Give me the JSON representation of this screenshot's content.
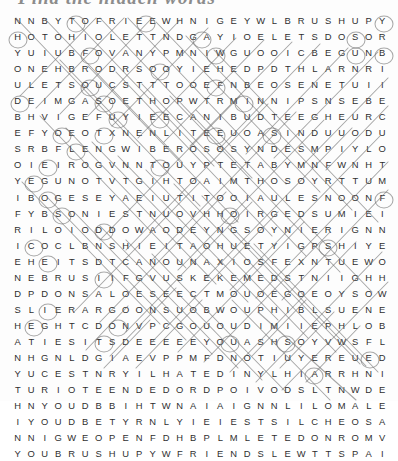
{
  "title": {
    "text": "Find the hidden words"
  },
  "puzzle": {
    "name": "word-search-grid",
    "rows": 24,
    "columns": 27,
    "letter_color": "#2f2f2f",
    "mark_color": "#6f6f6f",
    "background_color": "#fdfdfd",
    "grid": [
      "NNBYTOFRIEEWHNIGEYWLBRUSHUPY",
      "HOTOHIOLETTNDGAYIOELETSDOSOR",
      "YUIUBFOVANYPMNIWGUOOICBEGUNB",
      "ONEHBRODRSOOYIEHEDPDTHLARNRI",
      "ULETSOUCSTTTOOEFNBEOSENETUII",
      "DEIMGASOETHOPWTRMINNIPSNSEBE",
      "BHVIGEFUYIEECANIBUDTEEGHEURC",
      "EFYOEOTXNENLITEEUOASINDUUODUE",
      "SRBFLENGWIBEROSOSYNDESMPIYLOSS",
      "OIEIROGVNNTOUYPTETABYMNFWNHT",
      "YEGUNOTVTGIHTOAIMTHOSOYRTTUM",
      "IBOGESEYAEIUTITOOIAULESNOONFPA",
      "FYBSONIESTNUOVHHOIRGEDSUMIEIE",
      "RILOIODDOWAODEYNGSOYNIERIGNNW",
      "ICOCLBNSHIEITAOHUETYIGPSHIYE",
      "EHEITSDTCANOUNANAXIOSFEXNTUEWO",
      "NEBRUSIIFGVUSKEKEMEDSTNIIGHHDL",
      "DPDONSALOESEECTMOUOEGOEOYSOW",
      "SLIERARGOONSUOBWOUPHIBLSUENE",
      "HEGHTCDONVPCGOUOUDIMIIEPHLOBTL",
      "ATIESITSDEEEEEYOUASHSOYVWSFL",
      "NHGNLDGIAEVPPMFDNOTIUYEREUED",
      "YUCESTNRYILHATEDINYLHIARRHNI",
      "TURIOTEENDEDORDPOIVODSLTNWDEJD",
      "HNYOUDBBIHTWNAIAIGNNLILOMALEHY",
      "IYOUDBETYRNLYIEIESTSILCHEOSATC",
      "NNIGWEOPENFDHBPBPLMLETEDONROMV",
      "YOUBRUSHUPYWFRIRIENDSLEWTTSPAI"
    ],
    "grid_display": [
      [
        "N",
        "N",
        "B",
        "Y",
        "T",
        "O",
        "F",
        "R",
        "I",
        "E",
        "E",
        "W",
        "H",
        "N",
        "I",
        "G",
        "E",
        "Y",
        "W",
        "L",
        "B",
        "R",
        "U",
        "S",
        "H",
        "U",
        "P",
        "Y"
      ],
      [
        "H",
        "O",
        "T",
        "O",
        "H",
        "I",
        "O",
        "L",
        "E",
        "T",
        "T",
        "N",
        "D",
        "G",
        "A",
        "Y",
        "I",
        "O",
        "E",
        "L",
        "E",
        "T",
        "S",
        "D",
        "O",
        "S",
        "O",
        "R"
      ],
      [
        "Y",
        "U",
        "I",
        "U",
        "B",
        "F",
        "O",
        "V",
        "A",
        "N",
        "Y",
        "P",
        "M",
        "N",
        "I",
        "W",
        "G",
        "U",
        "O",
        "O",
        "I",
        "C",
        "B",
        "E",
        "G",
        "U",
        "N",
        "B"
      ],
      [
        "O",
        "N",
        "E",
        "H",
        "B",
        "R",
        "O",
        "D",
        "R",
        "S",
        "O",
        "O",
        "Y",
        "I",
        "E",
        "H",
        "E",
        "D",
        "P",
        "D",
        "T",
        "H",
        "L",
        "A",
        "R",
        "N",
        "R",
        "I"
      ],
      [
        "U",
        "L",
        "E",
        "T",
        "S",
        "O",
        "U",
        "C",
        "S",
        "T",
        "T",
        "T",
        "O",
        "O",
        "E",
        "F",
        "N",
        "B",
        "E",
        "O",
        "S",
        "E",
        "N",
        "E",
        "T",
        "U",
        "I",
        "I"
      ],
      [
        "D",
        "E",
        "I",
        "M",
        "G",
        "A",
        "S",
        "O",
        "E",
        "T",
        "H",
        "O",
        "P",
        "W",
        "T",
        "R",
        "M",
        "I",
        "N",
        "N",
        "I",
        "P",
        "S",
        "N",
        "S",
        "E",
        "B",
        "E"
      ],
      [
        "B",
        "H",
        "V",
        "I",
        "G",
        "E",
        "F",
        "U",
        "Y",
        "I",
        "E",
        "E",
        "C",
        "A",
        "N",
        "I",
        "B",
        "U",
        "D",
        "T",
        "E",
        "E",
        "G",
        "H",
        "E",
        "U",
        "R",
        "C"
      ],
      [
        "E",
        "F",
        "Y",
        "O",
        "E",
        "O",
        "T",
        "X",
        "N",
        "E",
        "N",
        "L",
        "I",
        "T",
        "E",
        "E",
        "U",
        "O",
        "A",
        "S",
        "I",
        "N",
        "D",
        "U",
        "U",
        "O",
        "D",
        "U"
      ],
      [
        "S",
        "R",
        "B",
        "F",
        "L",
        "E",
        "N",
        "G",
        "W",
        "I",
        "B",
        "E",
        "R",
        "O",
        "S",
        "O",
        "S",
        "Y",
        "N",
        "D",
        "E",
        "S",
        "M",
        "P",
        "I",
        "Y",
        "L",
        "O"
      ],
      [
        "O",
        "I",
        "E",
        "I",
        "R",
        "O",
        "G",
        "V",
        "N",
        "N",
        "T",
        "O",
        "U",
        "Y",
        "P",
        "T",
        "E",
        "T",
        "A",
        "B",
        "Y",
        "M",
        "N",
        "F",
        "W",
        "N",
        "H",
        "T"
      ],
      [
        "Y",
        "E",
        "G",
        "U",
        "N",
        "O",
        "T",
        "V",
        "T",
        "G",
        "I",
        "H",
        "T",
        "O",
        "A",
        "I",
        "M",
        "T",
        "H",
        "O",
        "S",
        "O",
        "Y",
        "R",
        "T",
        "T",
        "U",
        "M"
      ],
      [
        "I",
        "B",
        "O",
        "G",
        "E",
        "S",
        "E",
        "Y",
        "A",
        "E",
        "I",
        "U",
        "T",
        "I",
        "T",
        "O",
        "O",
        "I",
        "A",
        "U",
        "L",
        "E",
        "S",
        "N",
        "O",
        "O",
        "N",
        "F"
      ],
      [
        "F",
        "Y",
        "B",
        "S",
        "O",
        "N",
        "I",
        "E",
        "S",
        "T",
        "N",
        "U",
        "O",
        "V",
        "H",
        "H",
        "O",
        "I",
        "R",
        "G",
        "E",
        "D",
        "S",
        "U",
        "M",
        "I",
        "E",
        "I"
      ],
      [
        "R",
        "I",
        "L",
        "O",
        "I",
        "O",
        "D",
        "D",
        "O",
        "W",
        "A",
        "O",
        "D",
        "E",
        "Y",
        "N",
        "G",
        "S",
        "O",
        "Y",
        "N",
        "I",
        "E",
        "R",
        "I",
        "G",
        "N",
        "N"
      ],
      [
        "I",
        "C",
        "O",
        "C",
        "L",
        "B",
        "N",
        "S",
        "H",
        "I",
        "E",
        "I",
        "T",
        "A",
        "O",
        "H",
        "U",
        "E",
        "T",
        "Y",
        "I",
        "G",
        "P",
        "S",
        "H",
        "I",
        "Y",
        "E"
      ],
      [
        "E",
        "H",
        "E",
        "I",
        "T",
        "S",
        "D",
        "T",
        "C",
        "A",
        "N",
        "O",
        "U",
        "N",
        "A",
        "X",
        "I",
        "O",
        "S",
        "F",
        "E",
        "X",
        "N",
        "T",
        "U",
        "E",
        "W",
        "O"
      ],
      [
        "N",
        "E",
        "B",
        "R",
        "U",
        "S",
        "I",
        "I",
        "F",
        "G",
        "V",
        "U",
        "S",
        "K",
        "E",
        "K",
        "E",
        "M",
        "E",
        "D",
        "S",
        "T",
        "N",
        "I",
        "I",
        "G",
        "H",
        "H"
      ],
      [
        "D",
        "P",
        "D",
        "O",
        "N",
        "S",
        "A",
        "L",
        "O",
        "E",
        "S",
        "E",
        "E",
        "C",
        "T",
        "M",
        "O",
        "U",
        "O",
        "E",
        "G",
        "O",
        "E",
        "O",
        "Y",
        "S",
        "O",
        "W"
      ],
      [
        "S",
        "L",
        "I",
        "E",
        "R",
        "A",
        "R",
        "G",
        "O",
        "O",
        "N",
        "S",
        "U",
        "O",
        "B",
        "W",
        "O",
        "U",
        "P",
        "H",
        "I",
        "B",
        "L",
        "S",
        "U",
        "E",
        "N",
        "E"
      ],
      [
        "H",
        "E",
        "G",
        "H",
        "T",
        "C",
        "D",
        "O",
        "N",
        "V",
        "P",
        "C",
        "G",
        "O",
        "U",
        "O",
        "U",
        "D",
        "I",
        "M",
        "I",
        "I",
        "E",
        "P",
        "H",
        "L",
        "O",
        "B"
      ],
      [
        "A",
        "T",
        "I",
        "E",
        "S",
        "I",
        "T",
        "S",
        "D",
        "E",
        "E",
        "E",
        "E",
        "E",
        "Y",
        "O",
        "U",
        "A",
        "S",
        "H",
        "S",
        "O",
        "Y",
        "V",
        "W",
        "S",
        "F",
        "L"
      ],
      [
        "N",
        "H",
        "G",
        "N",
        "L",
        "D",
        "G",
        "I",
        "A",
        "E",
        "V",
        "P",
        "P",
        "M",
        "F",
        "D",
        "N",
        "O",
        "T",
        "I",
        "U",
        "Y",
        "E",
        "R",
        "E",
        "U",
        "E",
        "D"
      ],
      [
        "Y",
        "U",
        "C",
        "E",
        "S",
        "T",
        "N",
        "R",
        "Y",
        "I",
        "L",
        "H",
        "A",
        "T",
        "E",
        "D",
        "I",
        "N",
        "Y",
        "L",
        "H",
        "I",
        "A",
        "R",
        "R",
        "H",
        "N",
        "I"
      ],
      [
        "T",
        "U",
        "R",
        "I",
        "O",
        "T",
        "E",
        "E",
        "N",
        "D",
        "E",
        "D",
        "O",
        "R",
        "D",
        "P",
        "O",
        "I",
        "V",
        "O",
        "D",
        "S",
        "L",
        "T",
        "N",
        "W",
        "D",
        "E"
      ],
      [
        "H",
        "N",
        "Y",
        "O",
        "U",
        "D",
        "B",
        "B",
        "I",
        "H",
        "T",
        "W",
        "N",
        "A",
        "I",
        "A",
        "I",
        "G",
        "N",
        "N",
        "L",
        "I",
        "L",
        "O",
        "M",
        "A",
        "L",
        "E"
      ],
      [
        "I",
        "Y",
        "O",
        "U",
        "D",
        "B",
        "E",
        "T",
        "Y",
        "R",
        "N",
        "L",
        "Y",
        "I",
        "E",
        "I",
        "E",
        "S",
        "T",
        "S",
        "I",
        "L",
        "C",
        "H",
        "E",
        "O",
        "S",
        "A"
      ],
      [
        "N",
        "N",
        "I",
        "G",
        "W",
        "E",
        "O",
        "P",
        "E",
        "N",
        "F",
        "D",
        "H",
        "B",
        "P",
        "L",
        "M",
        "L",
        "E",
        "T",
        "E",
        "D",
        "O",
        "N",
        "R",
        "O",
        "M",
        "V"
      ],
      [
        "Y",
        "O",
        "U",
        "B",
        "R",
        "U",
        "S",
        "H",
        "U",
        "P",
        "Y",
        "W",
        "F",
        "R",
        "I",
        "E",
        "N",
        "D",
        "S",
        "L",
        "E",
        "W",
        "T",
        "T",
        "S",
        "P",
        "A",
        "I"
      ]
    ]
  }
}
